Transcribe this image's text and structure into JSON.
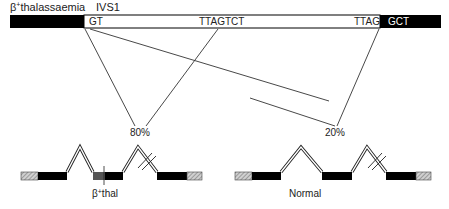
{
  "header": {
    "beta_symbol": "β",
    "superscript": "+",
    "title_rest": "thalassaemia",
    "intron_label": "IVS1"
  },
  "intron_bar": {
    "left_exon_color": "#000000",
    "right_exon_color": "#000000",
    "intron_fill": "#ffffff",
    "left_donor": "GT",
    "cryptic_site": "TTAGTCT",
    "acceptor": "TTAG",
    "right_exon_seq": "GCT"
  },
  "splicing": {
    "abnormal_pct": "80%",
    "normal_pct": "20%"
  },
  "genes": [
    {
      "id": "thal",
      "label_beta": "β",
      "label_sup": "+",
      "label_rest": "thal"
    },
    {
      "id": "normal",
      "label": "Normal"
    }
  ],
  "colors": {
    "exon": "#000000",
    "utr_hatch": "#999999",
    "line": "#333333",
    "mutant_exon": "#555555"
  }
}
